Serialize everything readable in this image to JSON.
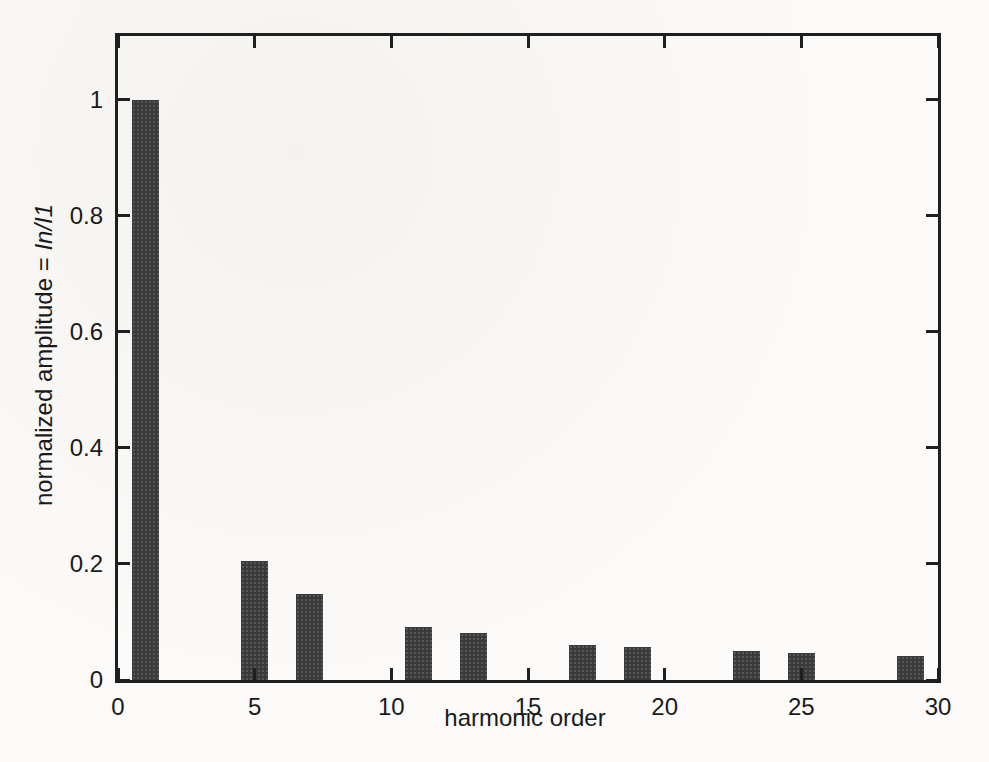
{
  "chart_data": {
    "type": "bar",
    "title": "",
    "xlabel": "harmonic order",
    "ylabel": "normalized amplitude = In/I1",
    "ylabel_plain": "normalized amplitude = ",
    "ylabel_italic": "In/I1",
    "categories": [
      1,
      5,
      7,
      11,
      13,
      17,
      19,
      23,
      25,
      29
    ],
    "values": [
      1.0,
      0.205,
      0.148,
      0.092,
      0.081,
      0.061,
      0.057,
      0.05,
      0.047,
      0.042
    ],
    "bar_width_units": 1,
    "xlim": [
      0,
      30
    ],
    "ylim": [
      0,
      1.11
    ],
    "xticks": [
      0,
      5,
      10,
      15,
      20,
      25,
      30
    ],
    "xtick_labels": [
      "0",
      "5",
      "10",
      "15",
      "20",
      "25",
      "30"
    ],
    "yticks": [
      0,
      0.2,
      0.4,
      0.6,
      0.8,
      1
    ],
    "ytick_labels": [
      "0",
      "0.2",
      "0.4",
      "0.6",
      "0.8",
      "1"
    ],
    "grid": false,
    "legend_position": "none",
    "tick_direction": "in",
    "box": true,
    "bar_color": "#3a3a3a",
    "axis_color": "#1f1f1f",
    "background_color": "#fbfaf8"
  }
}
